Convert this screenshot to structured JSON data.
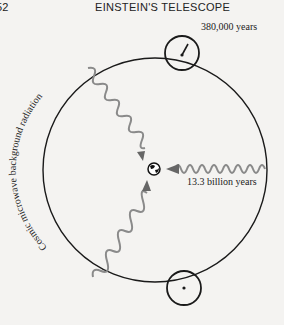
{
  "page": {
    "number": "52",
    "running_head": "EINSTEIN'S TELESCOPE"
  },
  "diagram": {
    "labels": {
      "top_circle": "380,000 years",
      "right_wave": "13.3 billion years",
      "arc_label": "Cosmic microwave background radiation"
    },
    "colors": {
      "line": "#1a1a1a",
      "wave": "#8a8a8a",
      "background": "#f4f3f1"
    },
    "elements": [
      {
        "id": "universe-boundary",
        "shape": "circle",
        "cx": 155,
        "cy": 170,
        "r": 112
      },
      {
        "id": "earth",
        "shape": "globe",
        "cx": 154,
        "cy": 169,
        "r": 6
      },
      {
        "id": "patch-top",
        "shape": "circle",
        "cx": 182,
        "cy": 53,
        "r": 17
      },
      {
        "id": "patch-bottom",
        "shape": "circle",
        "cx": 184,
        "cy": 288,
        "r": 17
      },
      {
        "id": "wave-upper-left",
        "from": [
          88,
          68
        ],
        "to": [
          143,
          160
        ]
      },
      {
        "id": "wave-lower-left",
        "from": [
          93,
          277
        ],
        "to": [
          147,
          181
        ]
      },
      {
        "id": "wave-right",
        "from": [
          265,
          169
        ],
        "to": [
          166,
          169
        ]
      }
    ]
  }
}
